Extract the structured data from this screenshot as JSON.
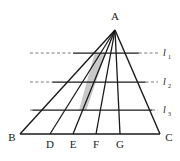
{
  "figure": {
    "background_color": "#ffffff",
    "stroke_color": "#1a1a1a",
    "shaded_fill_color": "#c9c9c9",
    "dashed_color": "#6b6b6b",
    "apex": {
      "name": "A",
      "label": "A",
      "x": 115,
      "y": 30,
      "label_x": 115,
      "label_y": 17
    },
    "baseline": {
      "left": {
        "name": "B",
        "label": "B",
        "x": 20,
        "y": 134,
        "label_x": 12,
        "label_y": 142
      },
      "right": {
        "name": "C",
        "label": "C",
        "x": 160,
        "y": 134,
        "label_x": 168,
        "label_y": 142
      }
    },
    "base_points": [
      {
        "name": "D",
        "label": "D",
        "x": 50,
        "y": 134,
        "label_x": 50,
        "label_y": 147
      },
      {
        "name": "E",
        "label": "E",
        "x": 73,
        "y": 134,
        "label_x": 73,
        "label_y": 147
      },
      {
        "name": "F",
        "label": "F",
        "x": 96,
        "y": 134,
        "label_x": 96,
        "label_y": 147
      },
      {
        "name": "G",
        "label": "G",
        "x": 120,
        "y": 134,
        "label_x": 120,
        "label_y": 147
      }
    ],
    "transversals": [
      {
        "id": "l1",
        "label": "l",
        "subscript": "1",
        "y": 53,
        "solid_x1": 73.1,
        "solid_x2": 138.8,
        "dash_left_x1": 30,
        "dash_left_x2": 73.1,
        "dash_right_x1": 138.8,
        "dash_right_x2": 158,
        "label_x": 163,
        "label_y": 56
      },
      {
        "id": "l2",
        "label": "l",
        "subscript": "2",
        "y": 82,
        "solid_x1": 52.3,
        "solid_x2": 145.6,
        "dash_left_x1": 30,
        "dash_left_x2": 52.3,
        "dash_right_x1": 145.6,
        "dash_right_x2": 158,
        "label_x": 163,
        "label_y": 85
      },
      {
        "id": "l3",
        "label": "l",
        "subscript": "3",
        "y": 110,
        "solid_x1": 32.3,
        "solid_x2": 152.2,
        "dash_left_x1": 30,
        "dash_left_x2": 32.3,
        "dash_right_x1": 152.2,
        "dash_right_x2": 158,
        "label_x": 163,
        "label_y": 113
      }
    ],
    "cevians": [
      {
        "id": "cevian-AB",
        "from": "A",
        "to": "B",
        "x1": 115,
        "y1": 30,
        "x2": 20,
        "y2": 134
      },
      {
        "id": "cevian-AD",
        "from": "A",
        "to": "D",
        "x1": 115,
        "y1": 30,
        "x2": 50,
        "y2": 134
      },
      {
        "id": "cevian-AE",
        "from": "A",
        "to": "E",
        "x1": 115,
        "y1": 30,
        "x2": 73,
        "y2": 134
      },
      {
        "id": "cevian-AF",
        "from": "A",
        "to": "F",
        "x1": 115,
        "y1": 30,
        "x2": 96,
        "y2": 134
      },
      {
        "id": "cevian-AG",
        "from": "A",
        "to": "G",
        "x1": 115,
        "y1": 30,
        "x2": 120,
        "y2": 134
      },
      {
        "id": "cevian-AC",
        "from": "A",
        "to": "C",
        "x1": 115,
        "y1": 30,
        "x2": 160,
        "y2": 134
      }
    ],
    "shaded_region": {
      "id": "shaded-quadrilateral",
      "description": "region between cevians AE and AF, bounded above by l1 and below by l3",
      "points": "94.7,53 105.7,53 86.4,110 79.1,110"
    }
  }
}
